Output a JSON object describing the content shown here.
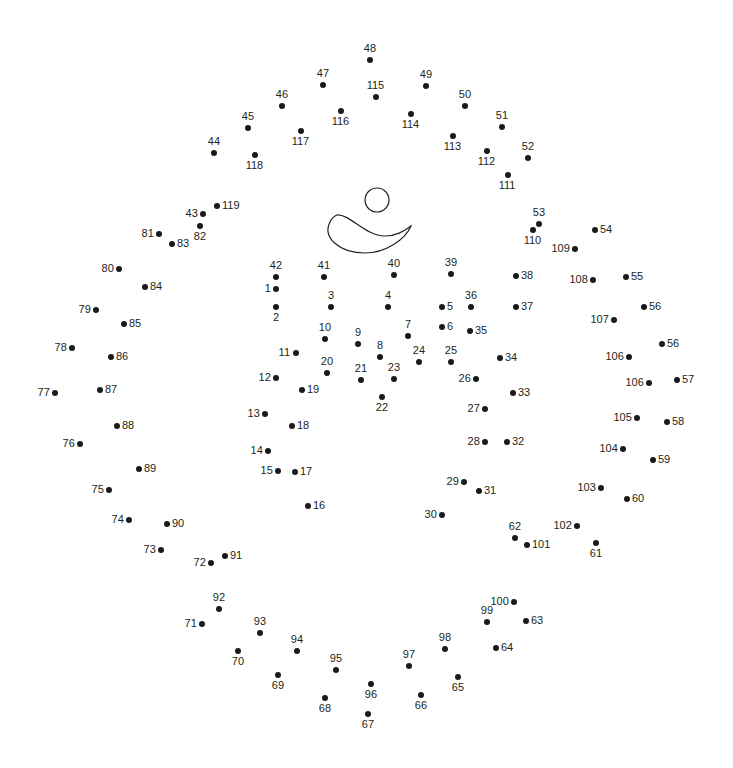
{
  "colors": {
    "dot": "#1a1a1a",
    "label": "#231f20",
    "background": "#ffffff",
    "outline": "#231f20"
  },
  "picture": {
    "head_circle": {
      "cx": 377,
      "cy": 200,
      "r": 12
    },
    "swoosh_shape": "M337 215 C 350 214, 365 236, 385 236 C 398 236, 405 230, 411 226 C 405 240, 385 253, 365 253 C 340 253, 322 238, 330 222 C 332 218, 334 216, 337 215 Z"
  },
  "dots": [
    {
      "n": "1",
      "x": 276,
      "y": 289,
      "lp": "l"
    },
    {
      "n": "2",
      "x": 276,
      "y": 307,
      "lp": "b"
    },
    {
      "n": "3",
      "x": 331,
      "y": 307,
      "lp": "t"
    },
    {
      "n": "4",
      "x": 388,
      "y": 307,
      "lp": "t"
    },
    {
      "n": "5",
      "x": 442,
      "y": 307,
      "lp": "r"
    },
    {
      "n": "6",
      "x": 442,
      "y": 327,
      "lp": "r"
    },
    {
      "n": "7",
      "x": 408,
      "y": 336,
      "lp": "t"
    },
    {
      "n": "8",
      "x": 380,
      "y": 357,
      "lp": "t"
    },
    {
      "n": "9",
      "x": 358,
      "y": 344,
      "lp": "t"
    },
    {
      "n": "10",
      "x": 325,
      "y": 339,
      "lp": "t"
    },
    {
      "n": "11",
      "x": 296,
      "y": 353,
      "lp": "l"
    },
    {
      "n": "12",
      "x": 276,
      "y": 378,
      "lp": "l"
    },
    {
      "n": "13",
      "x": 265,
      "y": 414,
      "lp": "l"
    },
    {
      "n": "14",
      "x": 268,
      "y": 451,
      "lp": "l"
    },
    {
      "n": "15",
      "x": 278,
      "y": 471,
      "lp": "l"
    },
    {
      "n": "16",
      "x": 308,
      "y": 506,
      "lp": "r"
    },
    {
      "n": "17",
      "x": 295,
      "y": 472,
      "lp": "r"
    },
    {
      "n": "18",
      "x": 292,
      "y": 426,
      "lp": "r"
    },
    {
      "n": "19",
      "x": 302,
      "y": 390,
      "lp": "r"
    },
    {
      "n": "20",
      "x": 327,
      "y": 373,
      "lp": "t"
    },
    {
      "n": "21",
      "x": 361,
      "y": 380,
      "lp": "t"
    },
    {
      "n": "22",
      "x": 382,
      "y": 397,
      "lp": "b"
    },
    {
      "n": "23",
      "x": 394,
      "y": 379,
      "lp": "t"
    },
    {
      "n": "24",
      "x": 419,
      "y": 362,
      "lp": "t"
    },
    {
      "n": "25",
      "x": 451,
      "y": 362,
      "lp": "t"
    },
    {
      "n": "26",
      "x": 476,
      "y": 379,
      "lp": "l"
    },
    {
      "n": "27",
      "x": 485,
      "y": 409,
      "lp": "l"
    },
    {
      "n": "28",
      "x": 485,
      "y": 442,
      "lp": "l"
    },
    {
      "n": "29",
      "x": 464,
      "y": 482,
      "lp": "l"
    },
    {
      "n": "30",
      "x": 442,
      "y": 515,
      "lp": "l"
    },
    {
      "n": "31",
      "x": 479,
      "y": 491,
      "lp": "r"
    },
    {
      "n": "32",
      "x": 507,
      "y": 442,
      "lp": "r"
    },
    {
      "n": "33",
      "x": 513,
      "y": 393,
      "lp": "r"
    },
    {
      "n": "34",
      "x": 500,
      "y": 358,
      "lp": "r"
    },
    {
      "n": "35",
      "x": 470,
      "y": 331,
      "lp": "r"
    },
    {
      "n": "36",
      "x": 471,
      "y": 307,
      "lp": "t"
    },
    {
      "n": "37",
      "x": 516,
      "y": 307,
      "lp": "r"
    },
    {
      "n": "38",
      "x": 516,
      "y": 276,
      "lp": "r"
    },
    {
      "n": "39",
      "x": 451,
      "y": 274,
      "lp": "t"
    },
    {
      "n": "40",
      "x": 394,
      "y": 275,
      "lp": "t"
    },
    {
      "n": "41",
      "x": 324,
      "y": 277,
      "lp": "t"
    },
    {
      "n": "42",
      "x": 276,
      "y": 277,
      "lp": "t"
    },
    {
      "n": "43",
      "x": 203,
      "y": 214,
      "lp": "l"
    },
    {
      "n": "44",
      "x": 214,
      "y": 153,
      "lp": "t"
    },
    {
      "n": "45",
      "x": 248,
      "y": 128,
      "lp": "t"
    },
    {
      "n": "46",
      "x": 282,
      "y": 106,
      "lp": "t"
    },
    {
      "n": "47",
      "x": 323,
      "y": 85,
      "lp": "t"
    },
    {
      "n": "48",
      "x": 370,
      "y": 60,
      "lp": "t"
    },
    {
      "n": "49",
      "x": 426,
      "y": 86,
      "lp": "t"
    },
    {
      "n": "50",
      "x": 465,
      "y": 106,
      "lp": "t"
    },
    {
      "n": "51",
      "x": 502,
      "y": 127,
      "lp": "t"
    },
    {
      "n": "52",
      "x": 528,
      "y": 158,
      "lp": "t"
    },
    {
      "n": "53",
      "x": 539,
      "y": 224,
      "lp": "t"
    },
    {
      "n": "54",
      "x": 595,
      "y": 230,
      "lp": "r"
    },
    {
      "n": "55",
      "x": 626,
      "y": 277,
      "lp": "r"
    },
    {
      "n": "56",
      "x": 644,
      "y": 307,
      "lp": "r"
    },
    {
      "n": "56",
      "x": 662,
      "y": 344,
      "lp": "r"
    },
    {
      "n": "57",
      "x": 677,
      "y": 380,
      "lp": "r"
    },
    {
      "n": "58",
      "x": 667,
      "y": 422,
      "lp": "r"
    },
    {
      "n": "59",
      "x": 653,
      "y": 460,
      "lp": "r"
    },
    {
      "n": "60",
      "x": 627,
      "y": 499,
      "lp": "r"
    },
    {
      "n": "61",
      "x": 596,
      "y": 543,
      "lp": "b"
    },
    {
      "n": "62",
      "x": 515,
      "y": 538,
      "lp": "t"
    },
    {
      "n": "63",
      "x": 526,
      "y": 621,
      "lp": "r"
    },
    {
      "n": "64",
      "x": 496,
      "y": 648,
      "lp": "r"
    },
    {
      "n": "65",
      "x": 458,
      "y": 677,
      "lp": "b"
    },
    {
      "n": "66",
      "x": 421,
      "y": 695,
      "lp": "b"
    },
    {
      "n": "67",
      "x": 368,
      "y": 714,
      "lp": "b"
    },
    {
      "n": "68",
      "x": 325,
      "y": 698,
      "lp": "b"
    },
    {
      "n": "69",
      "x": 278,
      "y": 675,
      "lp": "b"
    },
    {
      "n": "70",
      "x": 238,
      "y": 651,
      "lp": "b"
    },
    {
      "n": "71",
      "x": 202,
      "y": 624,
      "lp": "l"
    },
    {
      "n": "72",
      "x": 211,
      "y": 563,
      "lp": "l"
    },
    {
      "n": "73",
      "x": 161,
      "y": 550,
      "lp": "l"
    },
    {
      "n": "74",
      "x": 129,
      "y": 520,
      "lp": "l"
    },
    {
      "n": "75",
      "x": 109,
      "y": 490,
      "lp": "l"
    },
    {
      "n": "76",
      "x": 80,
      "y": 444,
      "lp": "l"
    },
    {
      "n": "77",
      "x": 55,
      "y": 393,
      "lp": "l"
    },
    {
      "n": "78",
      "x": 72,
      "y": 348,
      "lp": "l"
    },
    {
      "n": "79",
      "x": 96,
      "y": 310,
      "lp": "l"
    },
    {
      "n": "80",
      "x": 119,
      "y": 269,
      "lp": "l"
    },
    {
      "n": "81",
      "x": 159,
      "y": 234,
      "lp": "l"
    },
    {
      "n": "82",
      "x": 200,
      "y": 226,
      "lp": "b"
    },
    {
      "n": "83",
      "x": 172,
      "y": 244,
      "lp": "r"
    },
    {
      "n": "84",
      "x": 145,
      "y": 287,
      "lp": "r"
    },
    {
      "n": "85",
      "x": 124,
      "y": 324,
      "lp": "r"
    },
    {
      "n": "86",
      "x": 111,
      "y": 357,
      "lp": "r"
    },
    {
      "n": "87",
      "x": 100,
      "y": 390,
      "lp": "r"
    },
    {
      "n": "88",
      "x": 117,
      "y": 426,
      "lp": "r"
    },
    {
      "n": "89",
      "x": 139,
      "y": 469,
      "lp": "r"
    },
    {
      "n": "90",
      "x": 167,
      "y": 524,
      "lp": "r"
    },
    {
      "n": "91",
      "x": 225,
      "y": 556,
      "lp": "r"
    },
    {
      "n": "92",
      "x": 219,
      "y": 609,
      "lp": "t"
    },
    {
      "n": "93",
      "x": 260,
      "y": 633,
      "lp": "t"
    },
    {
      "n": "94",
      "x": 297,
      "y": 651,
      "lp": "t"
    },
    {
      "n": "95",
      "x": 336,
      "y": 670,
      "lp": "t"
    },
    {
      "n": "96",
      "x": 371,
      "y": 684,
      "lp": "b"
    },
    {
      "n": "97",
      "x": 409,
      "y": 666,
      "lp": "t"
    },
    {
      "n": "98",
      "x": 445,
      "y": 649,
      "lp": "t"
    },
    {
      "n": "99",
      "x": 487,
      "y": 622,
      "lp": "t"
    },
    {
      "n": "100",
      "x": 514,
      "y": 602,
      "lp": "l"
    },
    {
      "n": "101",
      "x": 527,
      "y": 545,
      "lp": "r"
    },
    {
      "n": "102",
      "x": 577,
      "y": 526,
      "lp": "l"
    },
    {
      "n": "103",
      "x": 601,
      "y": 488,
      "lp": "l"
    },
    {
      "n": "104",
      "x": 623,
      "y": 449,
      "lp": "l"
    },
    {
      "n": "105",
      "x": 637,
      "y": 418,
      "lp": "l"
    },
    {
      "n": "106",
      "x": 629,
      "y": 357,
      "lp": "l"
    },
    {
      "n": "106",
      "x": 649,
      "y": 383,
      "lp": "l"
    },
    {
      "n": "107",
      "x": 614,
      "y": 320,
      "lp": "l"
    },
    {
      "n": "108",
      "x": 593,
      "y": 280,
      "lp": "l"
    },
    {
      "n": "109",
      "x": 575,
      "y": 249,
      "lp": "l"
    },
    {
      "n": "110",
      "x": 533,
      "y": 230,
      "lp": "b"
    },
    {
      "n": "111",
      "x": 508,
      "y": 175,
      "lp": "b"
    },
    {
      "n": "112",
      "x": 487,
      "y": 151,
      "lp": "b"
    },
    {
      "n": "113",
      "x": 453,
      "y": 136,
      "lp": "b"
    },
    {
      "n": "114",
      "x": 411,
      "y": 114,
      "lp": "b"
    },
    {
      "n": "115",
      "x": 376,
      "y": 97,
      "lp": "t"
    },
    {
      "n": "116",
      "x": 341,
      "y": 111,
      "lp": "b"
    },
    {
      "n": "117",
      "x": 301,
      "y": 131,
      "lp": "b"
    },
    {
      "n": "118",
      "x": 255,
      "y": 155,
      "lp": "b"
    },
    {
      "n": "119",
      "x": 217,
      "y": 206,
      "lp": "r"
    }
  ]
}
